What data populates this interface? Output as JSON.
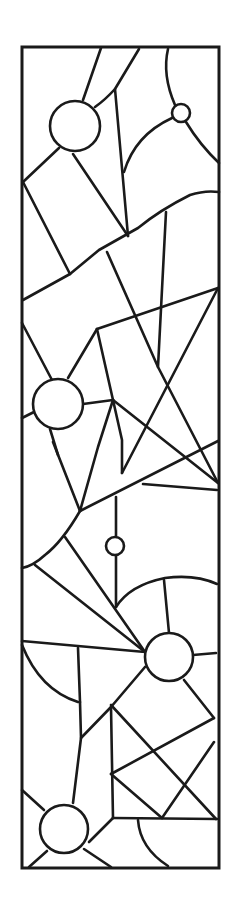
{
  "artwork": {
    "title": "Stained glass pattern (line art)",
    "style": "black lead lines on white",
    "colors": {
      "line": "#1a1a1a",
      "background": "#ffffff"
    },
    "frame": {
      "x": 22,
      "y": 47,
      "width": 197,
      "height": 821
    },
    "circles": [
      {
        "cx": 75,
        "cy": 126,
        "r": 25
      },
      {
        "cx": 181,
        "cy": 113,
        "r": 9
      },
      {
        "cx": 58,
        "cy": 404,
        "r": 25
      },
      {
        "cx": 115,
        "cy": 546,
        "r": 9
      },
      {
        "cx": 169,
        "cy": 657,
        "r": 24
      },
      {
        "cx": 64,
        "cy": 829,
        "r": 24
      }
    ]
  }
}
